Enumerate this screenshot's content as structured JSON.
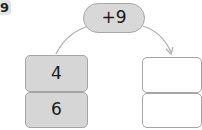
{
  "problem_number": "9",
  "operator": {
    "label": "+9"
  },
  "input_column": {
    "values": [
      "4",
      "6"
    ]
  },
  "output_column": {
    "values": [
      "",
      ""
    ]
  },
  "colors": {
    "filled": "#d6d6d6",
    "border": "#a5a5a5",
    "arrow": "#b0b0b0"
  }
}
